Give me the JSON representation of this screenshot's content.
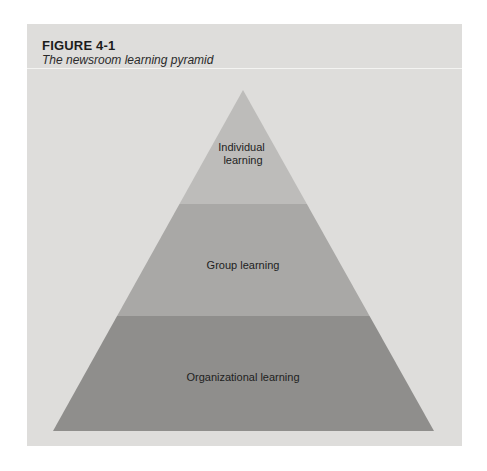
{
  "figure": {
    "number": "FIGURE 4-1",
    "title": "The newsroom learning pyramid"
  },
  "pyramid": {
    "tiers": [
      {
        "label_lines": [
          "Individual",
          "learning"
        ],
        "color": "#bdbcba"
      },
      {
        "label_lines": [
          "Group learning"
        ],
        "color": "#a9a8a6"
      },
      {
        "label_lines": [
          "Organizational learning"
        ],
        "color": "#8f8e8c"
      }
    ]
  },
  "colors": {
    "panel_background": "#dedddb",
    "text": "#1c1c1c"
  }
}
